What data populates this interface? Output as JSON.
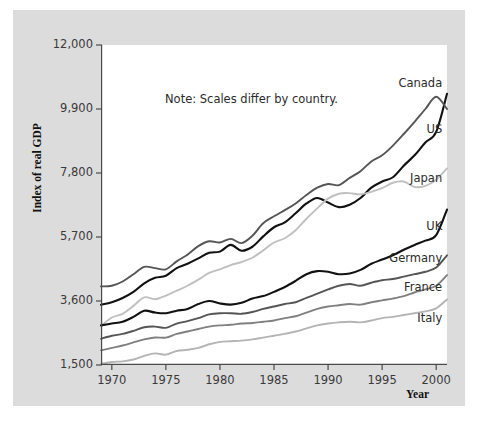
{
  "figure": {
    "note": "Note: Scales differ by country.",
    "ylabel": "Index of real GDP",
    "xlabel": "Year"
  },
  "chart_data": {
    "type": "line",
    "title": "",
    "subtitle": "",
    "xlabel": "Year",
    "ylabel": "Index of real GDP",
    "annotation": "Note: Scales differ by country.",
    "grid": false,
    "legend_position": "inline-right-end-of-line",
    "xlim": [
      1969,
      2001
    ],
    "ylim": [
      1500,
      12000
    ],
    "xticks": [
      1970,
      1975,
      1980,
      1985,
      1990,
      1995,
      2000
    ],
    "xticklabels": [
      "1970",
      "1975",
      "1980",
      "1985",
      "1990",
      "1995",
      "2000"
    ],
    "yticks": [
      1500,
      3600,
      5700,
      7800,
      9900,
      12000
    ],
    "yticklabels": [
      "1,500",
      "3,600",
      "5,700",
      "7,800",
      "9,900",
      "12,000"
    ],
    "x": [
      1969,
      1970,
      1971,
      1972,
      1973,
      1974,
      1975,
      1976,
      1977,
      1978,
      1979,
      1980,
      1981,
      1982,
      1983,
      1984,
      1985,
      1986,
      1987,
      1988,
      1989,
      1990,
      1991,
      1992,
      1993,
      1994,
      1995,
      1996,
      1997,
      1998,
      1999,
      2000,
      2001
    ],
    "series": [
      {
        "name": "Canada",
        "label": "Canada",
        "color": "#111111",
        "label_x": 2000,
        "label_y": 10750,
        "values": [
          3480,
          3560,
          3700,
          3900,
          4180,
          4360,
          4430,
          4680,
          4820,
          5000,
          5180,
          5220,
          5440,
          5250,
          5380,
          5720,
          6020,
          6180,
          6480,
          6800,
          6980,
          6830,
          6680,
          6760,
          6980,
          7320,
          7520,
          7660,
          8040,
          8380,
          8800,
          9150,
          10400
        ]
      },
      {
        "name": "US",
        "label": "US",
        "color": "#555555",
        "label_x": 2000,
        "label_y": 9250,
        "values": [
          4080,
          4100,
          4240,
          4480,
          4720,
          4680,
          4640,
          4900,
          5120,
          5400,
          5560,
          5520,
          5640,
          5500,
          5740,
          6150,
          6380,
          6580,
          6800,
          7080,
          7320,
          7440,
          7400,
          7640,
          7860,
          8180,
          8380,
          8700,
          9080,
          9480,
          9900,
          10300,
          9900
        ]
      },
      {
        "name": "Japan",
        "label": "Japan",
        "color": "#c0c0c0",
        "label_x": 2000,
        "label_y": 7650,
        "values": [
          2780,
          3060,
          3180,
          3440,
          3720,
          3660,
          3780,
          3940,
          4100,
          4300,
          4520,
          4640,
          4780,
          4880,
          5020,
          5260,
          5520,
          5660,
          5920,
          6300,
          6640,
          6960,
          7120,
          7140,
          7100,
          7180,
          7300,
          7480,
          7520,
          7340,
          7380,
          7580,
          7950
        ]
      },
      {
        "name": "UK",
        "label": "UK",
        "color": "#111111",
        "label_x": 2000,
        "label_y": 6050,
        "values": [
          2800,
          2860,
          2920,
          3080,
          3280,
          3220,
          3200,
          3280,
          3340,
          3500,
          3600,
          3520,
          3480,
          3540,
          3680,
          3760,
          3900,
          4060,
          4260,
          4480,
          4580,
          4560,
          4480,
          4500,
          4620,
          4820,
          4960,
          5100,
          5280,
          5440,
          5580,
          5760,
          6600
        ]
      },
      {
        "name": "Germany",
        "label": "Germany",
        "color": "#555555",
        "label_x": 2000,
        "label_y": 5000,
        "values": [
          2360,
          2460,
          2520,
          2620,
          2740,
          2760,
          2720,
          2860,
          2940,
          3040,
          3160,
          3200,
          3200,
          3180,
          3240,
          3340,
          3420,
          3500,
          3560,
          3700,
          3840,
          3980,
          4100,
          4160,
          4100,
          4200,
          4280,
          4320,
          4400,
          4480,
          4560,
          4700,
          5100
        ]
      },
      {
        "name": "France",
        "label": "France",
        "color": "#808080",
        "label_x": 2000,
        "label_y": 4050,
        "values": [
          1980,
          2060,
          2140,
          2240,
          2340,
          2400,
          2400,
          2520,
          2600,
          2680,
          2760,
          2800,
          2820,
          2860,
          2880,
          2920,
          2960,
          3040,
          3100,
          3220,
          3340,
          3420,
          3460,
          3500,
          3480,
          3560,
          3620,
          3680,
          3760,
          3880,
          3980,
          4100,
          4450
        ]
      },
      {
        "name": "Italy",
        "label": "Italy",
        "color": "#b4b4b4",
        "label_x": 2000,
        "label_y": 3050,
        "values": [
          1540,
          1600,
          1620,
          1680,
          1800,
          1880,
          1840,
          1960,
          2000,
          2060,
          2180,
          2260,
          2280,
          2300,
          2340,
          2400,
          2460,
          2520,
          2600,
          2700,
          2800,
          2860,
          2900,
          2920,
          2900,
          2960,
          3040,
          3080,
          3140,
          3200,
          3260,
          3360,
          3650
        ]
      }
    ]
  }
}
